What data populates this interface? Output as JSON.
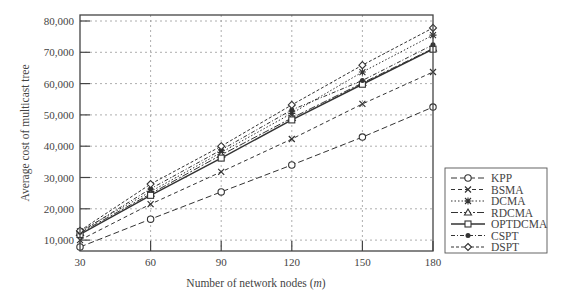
{
  "chart_data": {
    "type": "line",
    "title": "",
    "xlabel": "Number of network nodes (m)",
    "xlabel_parts": [
      "Number of network nodes (",
      "m",
      ")"
    ],
    "ylabel": "Average cost of multicast tree",
    "x": [
      30,
      60,
      90,
      120,
      150,
      180
    ],
    "x_tick_labels": [
      "30",
      "60",
      "90",
      "120",
      "150",
      "180"
    ],
    "y_ticks": [
      10000,
      20000,
      30000,
      40000,
      50000,
      60000,
      70000,
      80000
    ],
    "y_tick_labels": [
      "10,000",
      "20,000",
      "30,000",
      "40,000",
      "50,000",
      "60,000",
      "70,000",
      "80,000"
    ],
    "xlim": [
      30,
      180
    ],
    "ylim": [
      6500,
      81500
    ],
    "grid": true,
    "legend_position": "right-outside-bottom",
    "series": [
      {
        "name": "KPP",
        "marker": "circle",
        "dash": "6,3",
        "values": [
          7800,
          16700,
          25400,
          34000,
          42900,
          52500
        ]
      },
      {
        "name": "BSMA",
        "marker": "x",
        "dash": "4,3",
        "values": [
          10000,
          21500,
          31800,
          42300,
          53500,
          63700
        ]
      },
      {
        "name": "DCMA",
        "marker": "asterisk",
        "dash": "1.5,2",
        "values": [
          12800,
          25500,
          38000,
          50500,
          63700,
          75500
        ]
      },
      {
        "name": "RDCMA",
        "marker": "triangle",
        "dash": "7,2,2,2",
        "values": [
          12300,
          24800,
          37200,
          49000,
          60200,
          71200
        ]
      },
      {
        "name": "OPTDCMA",
        "marker": "square",
        "dash": "",
        "values": [
          11800,
          24300,
          36200,
          48400,
          59800,
          71000
        ]
      },
      {
        "name": "CSPT",
        "marker": "filled-circle",
        "dash": "4,2,1,2",
        "values": [
          12500,
          26400,
          38800,
          51600,
          61000,
          72400
        ]
      },
      {
        "name": "DSPT",
        "marker": "diamond",
        "dash": "3,2",
        "values": [
          13000,
          27900,
          40000,
          53200,
          65900,
          77800
        ]
      }
    ]
  }
}
